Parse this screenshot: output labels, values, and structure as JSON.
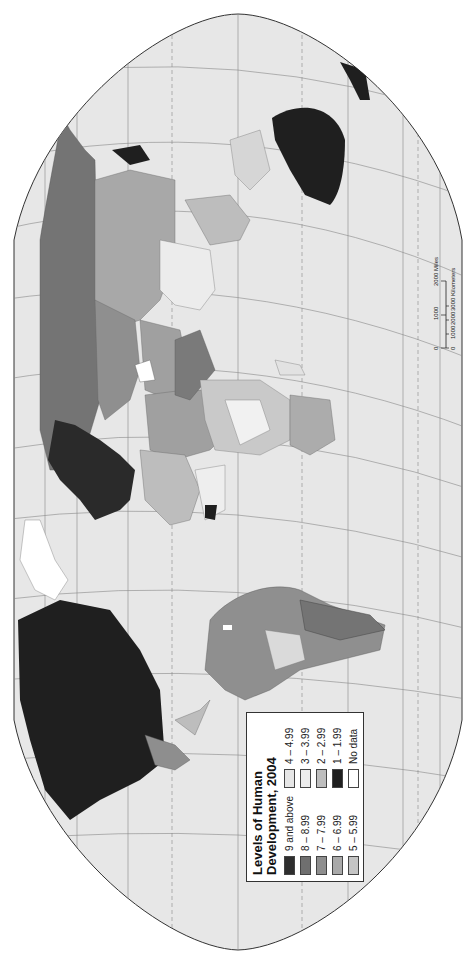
{
  "map": {
    "title": "Levels of Human Development, 2004",
    "orientation": "rotated 90 degrees clockwise",
    "background_color": "#ffffff",
    "ocean_color": "#e6e6e6",
    "graticule_color": "#7a7a7a"
  },
  "legend": {
    "title_line1": "Levels of Human",
    "title_line2": "Development, 2004",
    "items": [
      {
        "label": "9 and above",
        "color": "#2e2e2e"
      },
      {
        "label": "8 – 8.99",
        "color": "#6f6f6f"
      },
      {
        "label": "7 – 7.99",
        "color": "#8e8e8e"
      },
      {
        "label": "6 – 6.99",
        "color": "#a9a9a9"
      },
      {
        "label": "5 – 5.99",
        "color": "#c4c4c4"
      },
      {
        "label": "4 – 4.99",
        "color": "#e6e6e6"
      },
      {
        "label": "3 – 3.99",
        "color": "#ececec"
      },
      {
        "label": "2 – 2.99",
        "color": "#bdbdbd"
      },
      {
        "label": "1 – 1.99",
        "color": "#1f1f1f"
      },
      {
        "label": "No data",
        "color": "#ffffff"
      }
    ]
  },
  "scale_bar": {
    "miles_ticks": [
      "0",
      "1000",
      "2000 Miles"
    ],
    "km_ticks": [
      "0",
      "1000",
      "2000",
      "3000 Kilometers"
    ]
  }
}
